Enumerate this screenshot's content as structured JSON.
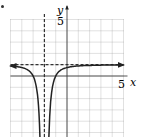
{
  "marker": "•",
  "chart_data": {
    "type": "line",
    "title": "",
    "xlabel": "x",
    "ylabel": "y",
    "xlim": [
      -5,
      5
    ],
    "ylim": [
      -5,
      5
    ],
    "grid": true,
    "tick_labels": {
      "x": [
        "5"
      ],
      "y": [
        "5"
      ]
    },
    "function": "y = 1 - 1/(x+2)^2",
    "asymptotes": {
      "vertical": {
        "x": -2,
        "style": "dashed"
      },
      "horizontal": {
        "y": 1,
        "style": "dashed"
      }
    },
    "series": [
      {
        "name": "left branch",
        "x": [
          -5,
          -4,
          -3,
          -2.5,
          -2.3
        ],
        "y": [
          0.89,
          0.75,
          0,
          -3,
          -10.1
        ]
      },
      {
        "name": "right branch",
        "x": [
          -1.7,
          -1.5,
          -1,
          0,
          1,
          3,
          5
        ],
        "y": [
          -10.1,
          -3,
          0,
          0.75,
          0.89,
          0.96,
          0.98
        ]
      }
    ],
    "colors": {
      "curve": "#222222",
      "grid": "#9a9a9a",
      "axis": "#444444"
    }
  }
}
